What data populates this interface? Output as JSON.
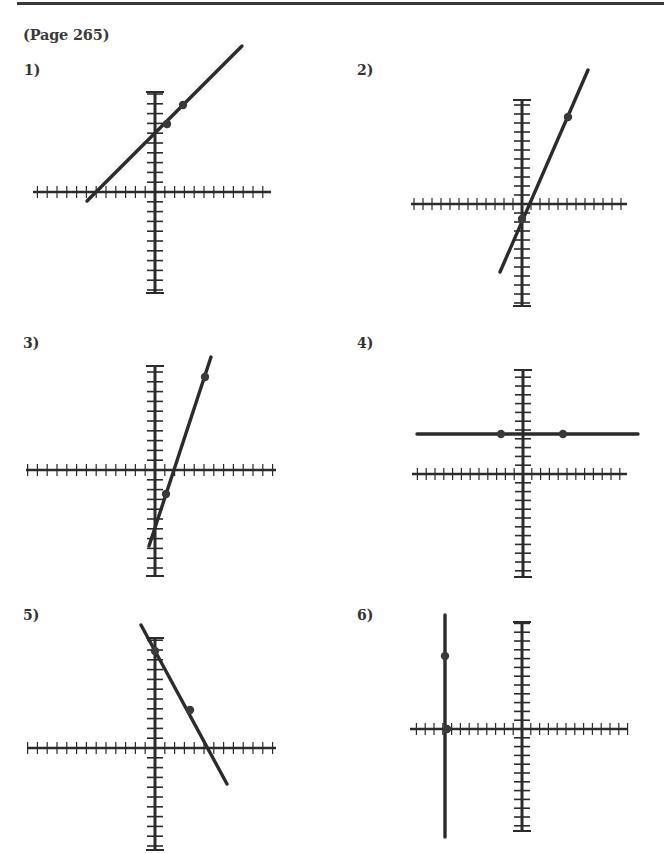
{
  "header": {
    "page_ref": "(Page 265)"
  },
  "colors": {
    "ink": "#2b2b2b",
    "rule": "#3a3a3a"
  },
  "problems": [
    {
      "label": "1)",
      "label_pos": [
        24,
        62
      ],
      "axes": {
        "ox": 155,
        "oy": 192,
        "x_from": 33,
        "x_to": 271,
        "y_from": 92,
        "y_to": 293,
        "step": 9.8
      },
      "line": [
        [
          87,
          201
        ],
        [
          242,
          46
        ]
      ],
      "points": [
        [
          167,
          124
        ],
        [
          183,
          105
        ]
      ]
    },
    {
      "label": "2)",
      "label_pos": [
        357,
        62
      ],
      "axes": {
        "ox": 522,
        "oy": 204,
        "x_from": 411,
        "x_to": 627,
        "y_from": 100,
        "y_to": 306,
        "step": 9
      },
      "line": [
        [
          500,
          272
        ],
        [
          588,
          70
        ]
      ],
      "points": [
        [
          522,
          219
        ],
        [
          568,
          117
        ]
      ]
    },
    {
      "label": "3)",
      "label_pos": [
        23,
        335
      ],
      "axes": {
        "ox": 155,
        "oy": 470,
        "x_from": 26,
        "x_to": 276,
        "y_from": 366,
        "y_to": 576,
        "step": 9.8
      },
      "line": [
        [
          149,
          546
        ],
        [
          211,
          357
        ]
      ],
      "points": [
        [
          166,
          494
        ],
        [
          205,
          377
        ]
      ]
    },
    {
      "label": "4)",
      "label_pos": [
        357,
        335
      ],
      "axes": {
        "ox": 523,
        "oy": 474,
        "x_from": 412,
        "x_to": 627,
        "y_from": 370,
        "y_to": 577,
        "step": 8.8
      },
      "line": [
        [
          417,
          434
        ],
        [
          638,
          434
        ]
      ],
      "points": [
        [
          501,
          434
        ],
        [
          563,
          434
        ]
      ]
    },
    {
      "label": "5)",
      "label_pos": [
        23,
        607
      ],
      "axes": {
        "ox": 155,
        "oy": 748,
        "x_from": 28,
        "x_to": 276,
        "y_from": 638,
        "y_to": 850,
        "step": 9.8
      },
      "line": [
        [
          141,
          625
        ],
        [
          227,
          784
        ]
      ],
      "points": [
        [
          155,
          651
        ],
        [
          190,
          710
        ]
      ]
    },
    {
      "label": "6)",
      "label_pos": [
        357,
        607
      ],
      "axes": {
        "ox": 522,
        "oy": 729,
        "x_from": 410,
        "x_to": 627,
        "y_from": 622,
        "y_to": 831,
        "step": 8.8
      },
      "line": [
        [
          445,
          615
        ],
        [
          445,
          837
        ]
      ],
      "points": [
        [
          445,
          656
        ],
        [
          447,
          729
        ]
      ]
    }
  ]
}
